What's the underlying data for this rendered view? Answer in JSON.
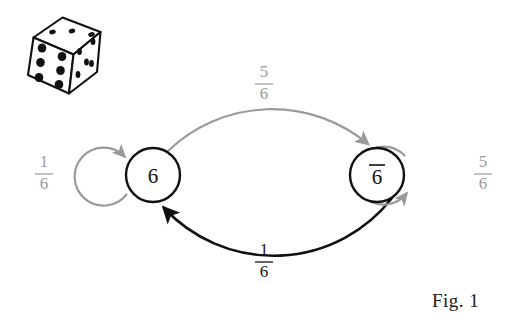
{
  "figure": {
    "caption": "Fig. 1",
    "background_color": "#ffffff",
    "width": 511,
    "height": 324
  },
  "colors": {
    "gray_edge": "#9a9a9a",
    "black_edge": "#111111",
    "node_stroke": "#111111",
    "text_black": "#111111",
    "text_gray": "#9a9a9a",
    "die_ink": "#111111"
  },
  "illustration": {
    "name": "die-illustration",
    "description": "line-drawn six-sided die",
    "faces": {
      "top_pips": 3,
      "front_pips": 6,
      "right_pips": 5
    }
  },
  "graph": {
    "nodes": [
      {
        "id": "six",
        "label": "6",
        "overline": false,
        "cx": 153,
        "cy": 175,
        "r": 27
      },
      {
        "id": "not-six",
        "label": "6",
        "overline": true,
        "cx": 377,
        "cy": 175,
        "r": 27
      }
    ],
    "edges": [
      {
        "id": "six-to-not-six",
        "from": "six",
        "to": "not-six",
        "label_numerator": "5",
        "label_denominator": "6",
        "color": "#9a9a9a",
        "position": "top",
        "label_x": 264,
        "label_y": 84
      },
      {
        "id": "not-six-to-six",
        "from": "not-six",
        "to": "six",
        "label_numerator": "1",
        "label_denominator": "6",
        "color": "#111111",
        "position": "bottom",
        "label_x": 264,
        "label_y": 262
      },
      {
        "id": "six-self-loop",
        "from": "six",
        "to": "six",
        "label_numerator": "1",
        "label_denominator": "6",
        "color": "#9a9a9a",
        "position": "left",
        "label_x": 44,
        "label_y": 174
      },
      {
        "id": "not-six-self-loop",
        "from": "not-six",
        "to": "not-six",
        "label_numerator": "5",
        "label_denominator": "6",
        "color": "#9a9a9a",
        "position": "right",
        "label_x": 483,
        "label_y": 174
      }
    ]
  }
}
